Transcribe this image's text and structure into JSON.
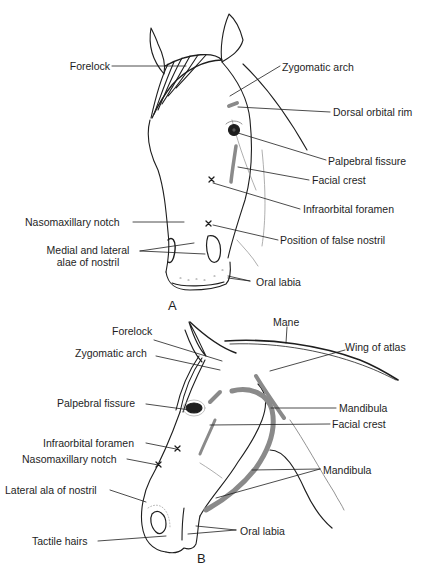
{
  "figure": {
    "panels": [
      {
        "id": "A",
        "letter": "A",
        "view": "frontal view of horse head",
        "labels": {
          "forelock": "Forelock",
          "zygomatic_arch": "Zygomatic arch",
          "dorsal_orbital_rim": "Dorsal orbital rim",
          "palpebral_fissure": "Palpebral fissure",
          "facial_crest": "Facial crest",
          "infraorbital_foramen": "Infraorbital foramen",
          "nasomaxillary_notch": "Nasomaxillary notch",
          "position_false_nostril": "Position of false nostril",
          "alae_line1": "Medial and lateral",
          "alae_line2": "alae of nostril",
          "oral_labia": "Oral labia"
        }
      },
      {
        "id": "B",
        "letter": "B",
        "view": "lateral view of horse head",
        "labels": {
          "mane": "Mane",
          "forelock": "Forelock",
          "wing_of_atlas": "Wing of atlas",
          "zygomatic_arch": "Zygomatic arch",
          "palpebral_fissure": "Palpebral fissure",
          "mandibula_upper": "Mandibula",
          "facial_crest": "Facial crest",
          "infraorbital_foramen": "Infraorbital foramen",
          "nasomaxillary_notch": "Nasomaxillary notch",
          "mandibula_lower": "Mandibula",
          "lateral_ala": "Lateral ala of nostril",
          "oral_labia": "Oral labia",
          "tactile_hairs": "Tactile hairs"
        }
      }
    ],
    "colors": {
      "line": "#1e1e1e",
      "shading": "#8a8a8a",
      "background": "#ffffff"
    }
  }
}
